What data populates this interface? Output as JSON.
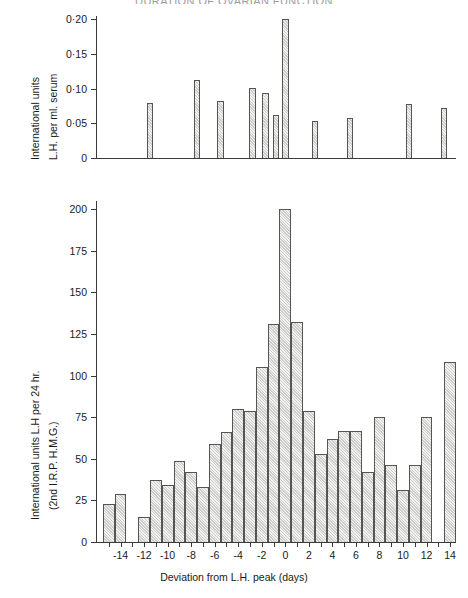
{
  "title": "DURATION OF OVARIAN FUNCTION",
  "figure": {
    "xlabel": "Deviation from L.H. peak  (days)",
    "xticks": [
      "-14",
      "-12",
      "-10",
      "-8",
      "-6",
      "-4",
      "-2",
      "0",
      "2",
      "4",
      "6",
      "8",
      "10",
      "12",
      "14"
    ]
  },
  "chart_data": [
    {
      "type": "bar",
      "title": "Serum L.H.",
      "xlabel": "Deviation from L.H. peak (days)",
      "ylabel": "International units L.H. per ml. serum",
      "ylabel_lines": [
        "International units",
        "L.H. per ml. serum"
      ],
      "ytick_labels": [
        "0",
        "0·05",
        "0·10",
        "0·15",
        "0·20"
      ],
      "ytick_values": [
        0,
        0.05,
        0.1,
        0.15,
        0.2
      ],
      "ylim": [
        0,
        0.205
      ],
      "xlim": [
        -15.5,
        15.0
      ],
      "grid": false,
      "legend": null,
      "bar_width_days": 0.55,
      "x": [
        -11.0,
        -7.0,
        -5.0,
        -2.3,
        -1.2,
        -0.3,
        0.5,
        3.0,
        6.0,
        11.0,
        14.0
      ],
      "values": [
        0.08,
        0.113,
        0.083,
        0.101,
        0.094,
        0.062,
        0.2,
        0.053,
        0.058,
        0.078,
        0.072
      ]
    },
    {
      "type": "bar",
      "title": "Urinary L.H.",
      "xlabel": "Deviation from L.H. peak (days)",
      "ylabel": "International units L.H per 24 hr. (2nd I.R.P. H.M.G.)",
      "ylabel_lines": [
        "International units L.H per 24 hr.",
        "(2nd I.R.P. H.M.G.)"
      ],
      "ytick_labels": [
        "0",
        "25",
        "50",
        "75",
        "100",
        "125",
        "150",
        "175",
        "200"
      ],
      "ytick_values": [
        0,
        25,
        50,
        75,
        100,
        125,
        150,
        175,
        200
      ],
      "ylim": [
        0,
        205
      ],
      "xlim": [
        -15.5,
        15.0
      ],
      "grid": false,
      "legend": null,
      "bar_width_days": 1.0,
      "categories": [
        -15,
        -14,
        -13,
        -12,
        -11,
        -10,
        -9,
        -8,
        -7,
        -6,
        -5,
        -4,
        -3,
        -2,
        -1,
        0,
        1,
        2,
        3,
        4,
        5,
        6,
        7,
        8,
        9,
        10,
        11,
        12,
        13,
        14
      ],
      "values": [
        23,
        29,
        0,
        15,
        37,
        34,
        49,
        42,
        33,
        59,
        66,
        80,
        79,
        105,
        131,
        200,
        132,
        79,
        53,
        62,
        67,
        67,
        42,
        75,
        46,
        31,
        46,
        75,
        0,
        108
      ]
    }
  ]
}
